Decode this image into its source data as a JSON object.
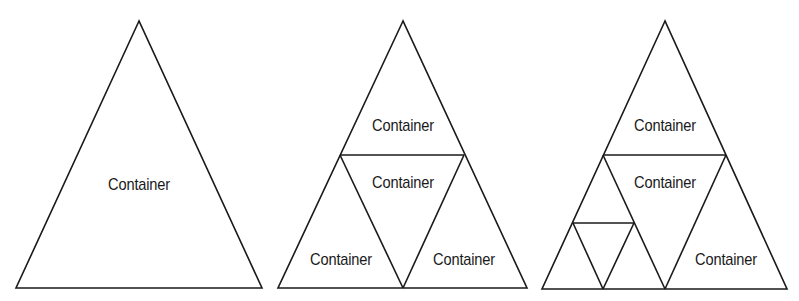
{
  "diagram": {
    "stroke_color": "#1a1a1a",
    "background": "#ffffff",
    "panels": [
      {
        "id": "stage-1",
        "outline": [
          [
            139,
            21
          ],
          [
            16,
            288
          ],
          [
            262,
            288
          ]
        ],
        "subdivisions": [],
        "labels": [
          {
            "text": "Container",
            "x": 139,
            "y": 185
          }
        ]
      },
      {
        "id": "stage-2",
        "outline": [
          [
            403,
            21
          ],
          [
            278,
            288
          ],
          [
            527,
            288
          ]
        ],
        "subdivisions": [
          [
            [
              340,
              155
            ],
            [
              464,
              155
            ]
          ],
          [
            [
              340,
              155
            ],
            [
              403,
              288
            ]
          ],
          [
            [
              464,
              155
            ],
            [
              403,
              288
            ]
          ]
        ],
        "labels": [
          {
            "text": "Container",
            "x": 403,
            "y": 126
          },
          {
            "text": "Container",
            "x": 403,
            "y": 183
          },
          {
            "text": "Container",
            "x": 341,
            "y": 260
          },
          {
            "text": "Container",
            "x": 464,
            "y": 260
          }
        ]
      },
      {
        "id": "stage-3",
        "outline": [
          [
            665,
            21
          ],
          [
            542,
            289
          ],
          [
            787,
            289
          ]
        ],
        "subdivisions": [
          [
            [
              603,
              155
            ],
            [
              726,
              155
            ]
          ],
          [
            [
              603,
              155
            ],
            [
              665,
              289
            ]
          ],
          [
            [
              726,
              155
            ],
            [
              665,
              289
            ]
          ],
          [
            [
              573,
              223
            ],
            [
              634,
              223
            ]
          ],
          [
            [
              573,
              223
            ],
            [
              603,
              289
            ]
          ],
          [
            [
              634,
              223
            ],
            [
              603,
              289
            ]
          ]
        ],
        "labels": [
          {
            "text": "Container",
            "x": 665,
            "y": 126
          },
          {
            "text": "Container",
            "x": 665,
            "y": 183
          },
          {
            "text": "Container",
            "x": 726,
            "y": 260
          }
        ]
      }
    ]
  }
}
